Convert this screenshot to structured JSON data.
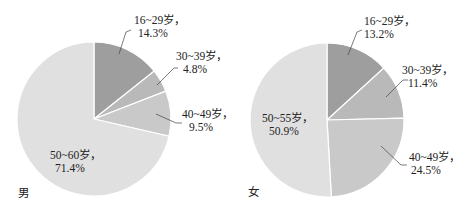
{
  "chart_data": [
    {
      "type": "pie",
      "title": "男",
      "start_angle": "12 o'clock, clockwise",
      "categories": [
        "16~29岁",
        "30~39岁",
        "40~49岁",
        "50~60岁"
      ],
      "values": [
        14.3,
        4.8,
        9.5,
        71.4
      ],
      "labels": [
        "16~29岁，14.3%",
        "30~39岁，4.8%",
        "40~49岁，9.5%",
        "50~60岁，71.4%"
      ],
      "colors": [
        "#9e9e9e",
        "#b9b9b9",
        "#c9c9c9",
        "#e0e0e0"
      ],
      "legend": "none (callout labels)"
    },
    {
      "type": "pie",
      "title": "女",
      "start_angle": "12 o'clock, clockwise",
      "categories": [
        "16~29岁",
        "30~39岁",
        "40~49岁",
        "50~55岁"
      ],
      "values": [
        13.2,
        11.4,
        24.5,
        50.9
      ],
      "labels": [
        "16~29岁，13.2%",
        "30~39岁，11.4%",
        "40~49岁，24.5%",
        "50~55岁，50.9%"
      ],
      "colors": [
        "#9e9e9e",
        "#b9b9b9",
        "#c9c9c9",
        "#e0e0e0"
      ],
      "legend": "none (callout labels)"
    }
  ],
  "charts": {
    "male": {
      "gender_label": "男",
      "slices": [
        {
          "age": "16~29岁，",
          "pct": "14.3%"
        },
        {
          "age": "30~39岁，",
          "pct": "4.8%"
        },
        {
          "age": "40~49岁，",
          "pct": "9.5%"
        },
        {
          "age": "50~60岁，",
          "pct": "71.4%"
        }
      ]
    },
    "female": {
      "gender_label": "女",
      "slices": [
        {
          "age": "16~29岁，",
          "pct": "13.2%"
        },
        {
          "age": "30~39岁，",
          "pct": "11.4%"
        },
        {
          "age": "40~49岁，",
          "pct": "24.5%"
        },
        {
          "age": "50~55岁，",
          "pct": "50.9%"
        }
      ]
    }
  }
}
